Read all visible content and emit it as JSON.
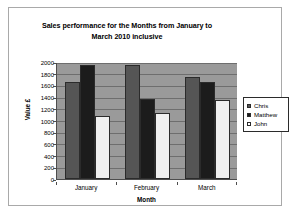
{
  "chart_data": {
    "type": "bar",
    "title": "Sales performance for the Months from January to March 2010  inclusive",
    "title_line1": "Sales performance for the Months from January to",
    "title_line2": "March 2010  inclusive",
    "xlabel": "Month",
    "ylabel": "Value £",
    "categories": [
      "January",
      "February",
      "March"
    ],
    "series": [
      {
        "name": "Chris",
        "values": [
          1650,
          1950,
          1740
        ],
        "color": "#555555"
      },
      {
        "name": "Matthew",
        "values": [
          1950,
          1360,
          1650
        ],
        "color": "#1c1c1c"
      },
      {
        "name": "John",
        "values": [
          1080,
          1120,
          1350
        ],
        "color": "#f0f0f0"
      }
    ],
    "ylim": [
      0,
      2000
    ],
    "ytick_values": [
      0,
      200,
      400,
      600,
      800,
      1000,
      1200,
      1400,
      1600,
      1800,
      2000
    ],
    "ytick_labels": [
      "0",
      "200",
      "400",
      "600",
      "800",
      "1000",
      "1200",
      "1400",
      "1600",
      "1800",
      "2000"
    ],
    "grid": true,
    "legend_position": "right",
    "plot_background": "#9a9a9a",
    "gridline_color": "#6e6e6e"
  }
}
